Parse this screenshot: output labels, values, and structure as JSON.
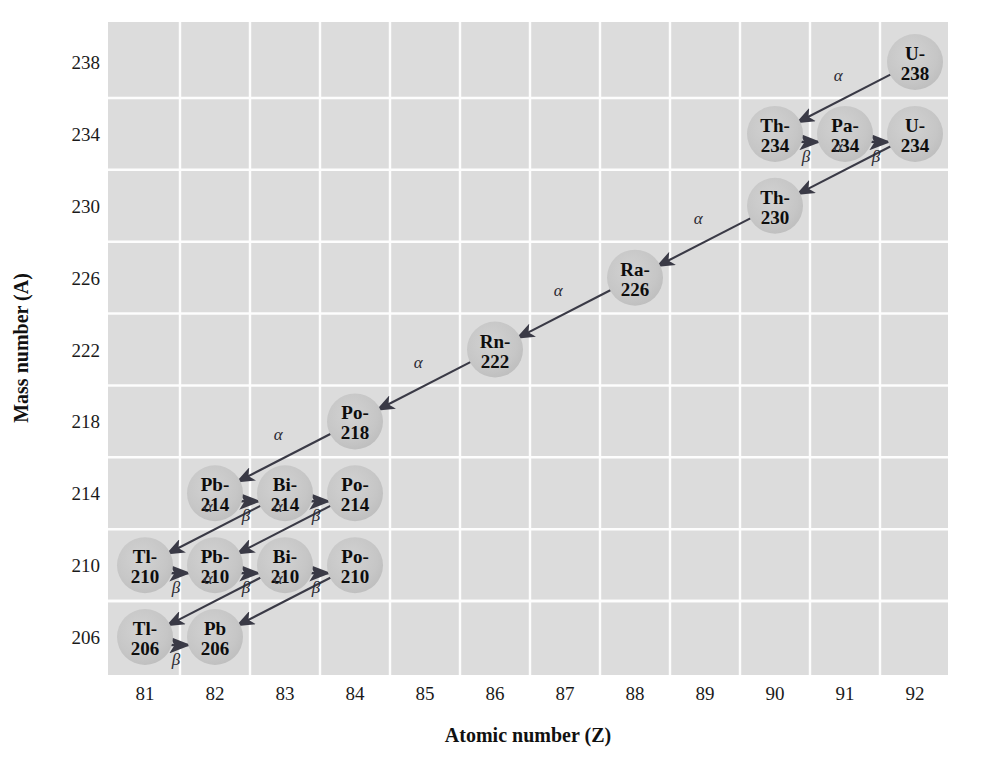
{
  "figure": {
    "background_color": "#ffffff",
    "plot_background_color": "#dcdcdc",
    "gridline_color": "#fdfdfd",
    "node_fill_color": "#c9c9c9",
    "arrow_color": "#3a3a46",
    "text_color": "#0d0d0d"
  },
  "axes": {
    "x_title": "Atomic number (Z)",
    "y_title": "Mass number (A)",
    "x_ticks": [
      "81",
      "82",
      "83",
      "84",
      "85",
      "86",
      "87",
      "88",
      "89",
      "90",
      "91",
      "92"
    ],
    "y_ticks": [
      "238",
      "234",
      "230",
      "226",
      "222",
      "218",
      "214",
      "210",
      "206"
    ]
  },
  "chart_data": {
    "type": "scatter",
    "xlabel": "Atomic number (Z)",
    "ylabel": "Mass number (A)",
    "xlim": [
      80.5,
      92.5
    ],
    "ylim": [
      204,
      240
    ],
    "x": [
      92,
      90,
      91,
      92,
      90,
      88,
      86,
      84,
      82,
      83,
      84,
      81,
      82,
      83,
      84,
      81,
      82
    ],
    "y": [
      238,
      234,
      234,
      234,
      230,
      226,
      222,
      218,
      214,
      214,
      214,
      210,
      210,
      210,
      210,
      206,
      206
    ],
    "grid": true,
    "legend": "none",
    "x_tick_values": [
      81,
      82,
      83,
      84,
      85,
      86,
      87,
      88,
      89,
      90,
      91,
      92
    ],
    "y_tick_values": [
      206,
      210,
      214,
      218,
      222,
      226,
      230,
      234,
      238
    ],
    "nodes": [
      {
        "id": "u238",
        "label_top": "U-",
        "label_bottom": "238",
        "z": 92,
        "a": 238
      },
      {
        "id": "th234",
        "label_top": "Th-",
        "label_bottom": "234",
        "z": 90,
        "a": 234
      },
      {
        "id": "pa234",
        "label_top": "Pa-",
        "label_bottom": "234",
        "z": 91,
        "a": 234
      },
      {
        "id": "u234",
        "label_top": "U-",
        "label_bottom": "234",
        "z": 92,
        "a": 234
      },
      {
        "id": "th230",
        "label_top": "Th-",
        "label_bottom": "230",
        "z": 90,
        "a": 230
      },
      {
        "id": "ra226",
        "label_top": "Ra-",
        "label_bottom": "226",
        "z": 88,
        "a": 226
      },
      {
        "id": "rn222",
        "label_top": "Rn-",
        "label_bottom": "222",
        "z": 86,
        "a": 222
      },
      {
        "id": "po218",
        "label_top": "Po-",
        "label_bottom": "218",
        "z": 84,
        "a": 218
      },
      {
        "id": "pb214",
        "label_top": "Pb-",
        "label_bottom": "214",
        "z": 82,
        "a": 214
      },
      {
        "id": "bi214",
        "label_top": "Bi-",
        "label_bottom": "214",
        "z": 83,
        "a": 214
      },
      {
        "id": "po214",
        "label_top": "Po-",
        "label_bottom": "214",
        "z": 84,
        "a": 214
      },
      {
        "id": "tl210",
        "label_top": "Tl-",
        "label_bottom": "210",
        "z": 81,
        "a": 210
      },
      {
        "id": "pb210",
        "label_top": "Pb-",
        "label_bottom": "210",
        "z": 82,
        "a": 210
      },
      {
        "id": "bi210",
        "label_top": "Bi-",
        "label_bottom": "210",
        "z": 83,
        "a": 210
      },
      {
        "id": "po210",
        "label_top": "Po-",
        "label_bottom": "210",
        "z": 84,
        "a": 210
      },
      {
        "id": "tl206",
        "label_top": "Tl-",
        "label_bottom": "206",
        "z": 81,
        "a": 206
      },
      {
        "id": "pb206",
        "label_top": "Pb",
        "label_bottom": "206",
        "z": 82,
        "a": 206
      }
    ],
    "decays": [
      {
        "from": "u238",
        "to": "th234",
        "type": "alpha",
        "symbol": "α"
      },
      {
        "from": "th234",
        "to": "pa234",
        "type": "beta",
        "symbol": "β"
      },
      {
        "from": "pa234",
        "to": "u234",
        "type": "beta",
        "symbol": "β"
      },
      {
        "from": "u234",
        "to": "th230",
        "type": "alpha",
        "symbol": "α"
      },
      {
        "from": "th230",
        "to": "ra226",
        "type": "alpha",
        "symbol": "α"
      },
      {
        "from": "ra226",
        "to": "rn222",
        "type": "alpha",
        "symbol": "α"
      },
      {
        "from": "rn222",
        "to": "po218",
        "type": "alpha",
        "symbol": "α"
      },
      {
        "from": "po218",
        "to": "pb214",
        "type": "alpha",
        "symbol": "α"
      },
      {
        "from": "pb214",
        "to": "bi214",
        "type": "beta",
        "symbol": "β"
      },
      {
        "from": "bi214",
        "to": "po214",
        "type": "beta",
        "symbol": "β"
      },
      {
        "from": "bi214",
        "to": "tl210",
        "type": "alpha",
        "symbol": "α"
      },
      {
        "from": "po214",
        "to": "pb210",
        "type": "alpha",
        "symbol": "α"
      },
      {
        "from": "tl210",
        "to": "pb210",
        "type": "beta",
        "symbol": "β"
      },
      {
        "from": "pb210",
        "to": "bi210",
        "type": "beta",
        "symbol": "β"
      },
      {
        "from": "bi210",
        "to": "po210",
        "type": "beta",
        "symbol": "β"
      },
      {
        "from": "bi210",
        "to": "tl206",
        "type": "alpha",
        "symbol": "α"
      },
      {
        "from": "po210",
        "to": "pb206",
        "type": "alpha",
        "symbol": "α"
      },
      {
        "from": "tl206",
        "to": "pb206",
        "type": "beta",
        "symbol": "β"
      }
    ]
  }
}
